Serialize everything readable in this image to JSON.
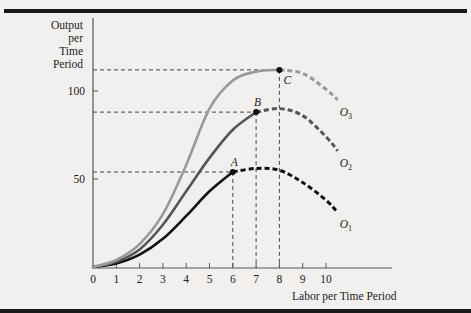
{
  "chart_data": {
    "type": "line",
    "title": "",
    "xlabel": "Labor per Time Period",
    "ylabel": "Output per Time Period",
    "ylabel_lines": [
      "Output",
      "per",
      "Time",
      "Period"
    ],
    "x_ticks": [
      0,
      1,
      2,
      3,
      4,
      5,
      6,
      7,
      8,
      9,
      10
    ],
    "y_ticks": [
      50,
      100
    ],
    "xlim": [
      0,
      11
    ],
    "ylim": [
      0,
      115
    ],
    "grid": false,
    "legend": "inline labels at curve ends",
    "series": [
      {
        "name": "O1",
        "label": "O",
        "subscript": "1",
        "color": "#111111",
        "solid_until_x": 6,
        "points": [
          [
            0,
            0
          ],
          [
            1,
            2
          ],
          [
            2,
            7
          ],
          [
            3,
            16
          ],
          [
            4,
            29
          ],
          [
            5,
            43
          ],
          [
            6,
            54
          ],
          [
            7,
            56
          ],
          [
            8,
            55
          ],
          [
            9,
            48
          ],
          [
            10,
            38
          ],
          [
            10.5,
            31
          ]
        ]
      },
      {
        "name": "O2",
        "label": "O",
        "subscript": "2",
        "color": "#555555",
        "solid_until_x": 7,
        "points": [
          [
            0,
            0
          ],
          [
            1,
            3
          ],
          [
            2,
            10
          ],
          [
            3,
            24
          ],
          [
            4,
            43
          ],
          [
            5,
            62
          ],
          [
            6,
            78
          ],
          [
            7,
            88
          ],
          [
            8,
            90
          ],
          [
            9,
            86
          ],
          [
            10,
            74
          ],
          [
            10.5,
            66
          ]
        ]
      },
      {
        "name": "O3",
        "label": "O",
        "subscript": "3",
        "color": "#999999",
        "solid_until_x": 8,
        "points": [
          [
            0,
            0
          ],
          [
            1,
            4
          ],
          [
            2,
            13
          ],
          [
            3,
            30
          ],
          [
            4,
            58
          ],
          [
            5,
            90
          ],
          [
            6,
            106
          ],
          [
            7,
            111
          ],
          [
            8,
            112
          ],
          [
            9,
            110
          ],
          [
            10,
            101
          ],
          [
            10.5,
            95
          ]
        ]
      }
    ],
    "annotations": [
      {
        "label": "A",
        "x": 6,
        "y": 54
      },
      {
        "label": "B",
        "x": 7,
        "y": 88
      },
      {
        "label": "C",
        "x": 8,
        "y": 112
      }
    ]
  },
  "axis": {
    "ylabel_1": "Output",
    "ylabel_2": "per",
    "ylabel_3": "Time",
    "ylabel_4": "Period",
    "xlabel": "Labor per Time Period"
  }
}
